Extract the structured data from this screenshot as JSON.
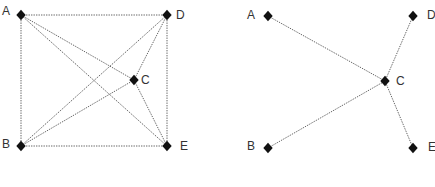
{
  "diagrams": [
    {
      "name": "complete-graph",
      "edge_style": "dotted",
      "nodes": [
        {
          "id": "A",
          "label": "A",
          "x": 21,
          "y": 15,
          "lx": 2,
          "ly": 12
        },
        {
          "id": "D",
          "label": "D",
          "x": 167,
          "y": 15,
          "lx": 176,
          "ly": 16
        },
        {
          "id": "C",
          "label": "C",
          "x": 134,
          "y": 80,
          "lx": 141,
          "ly": 81
        },
        {
          "id": "B",
          "label": "B",
          "x": 21,
          "y": 146,
          "lx": 2,
          "ly": 145
        },
        {
          "id": "E",
          "label": "E",
          "x": 167,
          "y": 146,
          "lx": 180,
          "ly": 147
        }
      ],
      "edges": [
        [
          "A",
          "D"
        ],
        [
          "A",
          "B"
        ],
        [
          "A",
          "C"
        ],
        [
          "A",
          "E"
        ],
        [
          "D",
          "B"
        ],
        [
          "D",
          "C"
        ],
        [
          "D",
          "E"
        ],
        [
          "B",
          "C"
        ],
        [
          "B",
          "E"
        ],
        [
          "C",
          "E"
        ]
      ]
    },
    {
      "name": "star-graph",
      "edge_style": "dotted",
      "nodes": [
        {
          "id": "A",
          "label": "A",
          "x": 268,
          "y": 16,
          "lx": 247,
          "ly": 16
        },
        {
          "id": "D",
          "label": "D",
          "x": 413,
          "y": 16,
          "lx": 427,
          "ly": 16
        },
        {
          "id": "C",
          "label": "C",
          "x": 385,
          "y": 81,
          "lx": 396,
          "ly": 82
        },
        {
          "id": "B",
          "label": "B",
          "x": 268,
          "y": 148,
          "lx": 247,
          "ly": 147
        },
        {
          "id": "E",
          "label": "E",
          "x": 413,
          "y": 148,
          "lx": 428,
          "ly": 148
        }
      ],
      "edges": [
        [
          "A",
          "C"
        ],
        [
          "B",
          "C"
        ],
        [
          "D",
          "C"
        ],
        [
          "E",
          "C"
        ]
      ]
    }
  ],
  "colors": {
    "background": "#ffffff",
    "node": "#111111",
    "edge": "#555555",
    "label": "#333333"
  }
}
